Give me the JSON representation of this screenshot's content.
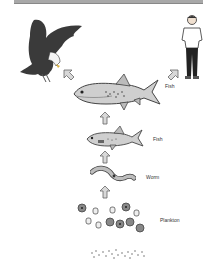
{
  "diagram": {
    "type": "food-chain",
    "nodes": [
      {
        "id": "eagle",
        "label": "",
        "icon": "eagle-icon"
      },
      {
        "id": "human",
        "label": "",
        "icon": "human-icon"
      },
      {
        "id": "large-fish",
        "label": "Fish",
        "icon": "large-fish-icon"
      },
      {
        "id": "small-fish",
        "label": "Fish",
        "icon": "small-fish-icon"
      },
      {
        "id": "worm",
        "label": "Worm",
        "icon": "worm-icon"
      },
      {
        "id": "plankton",
        "label": "Plankton",
        "icon": "plankton-icon"
      },
      {
        "id": "particles",
        "label": "",
        "icon": "particles-icon"
      }
    ],
    "edges": [
      {
        "from": "particles",
        "to": "plankton"
      },
      {
        "from": "plankton",
        "to": "worm"
      },
      {
        "from": "worm",
        "to": "small-fish"
      },
      {
        "from": "small-fish",
        "to": "large-fish"
      },
      {
        "from": "large-fish",
        "to": "eagle"
      },
      {
        "from": "large-fish",
        "to": "human"
      }
    ],
    "colors": {
      "arrow_fill": "#d8d8d8",
      "arrow_stroke": "#666666",
      "ink": "#333333"
    }
  }
}
